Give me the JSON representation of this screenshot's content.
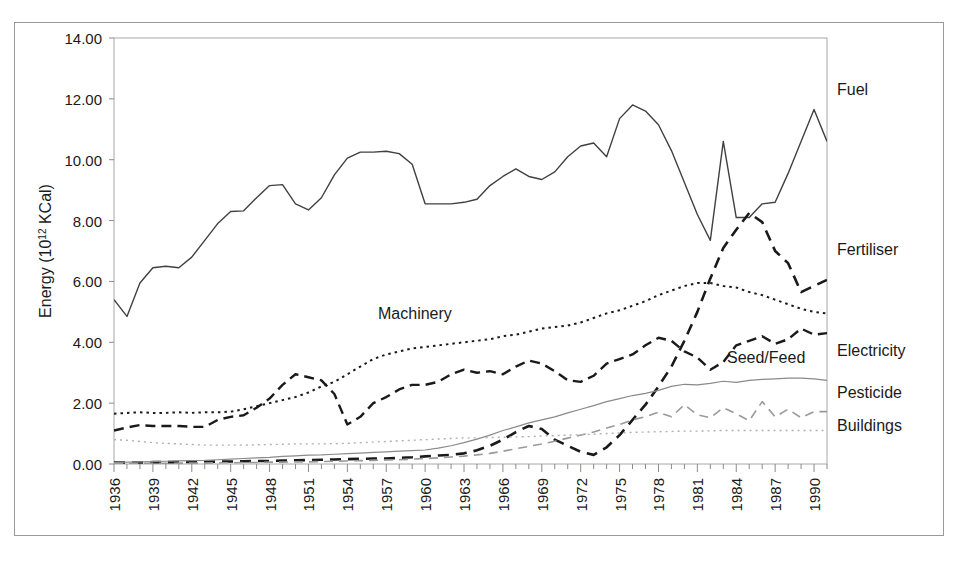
{
  "figure": {
    "frame_color": "#9a9a9a",
    "background": "#ffffff"
  },
  "chart_data": {
    "type": "line",
    "title": "",
    "xlabel": "Year",
    "ylabel": "Energy (10 12 KCal)",
    "ylabel_base": "Energy (10",
    "ylabel_sup": "12",
    "ylabel_tail": " KCal)",
    "grid": false,
    "legend_position": "right-inline-labels",
    "xlim": [
      1936,
      1991
    ],
    "ylim": [
      0,
      14
    ],
    "ytick_labels": [
      "14.00",
      "12.00",
      "10.00",
      "8.00",
      "6.00",
      "4.00",
      "2.00",
      "0.00"
    ],
    "ytick_values": [
      14,
      12,
      10,
      8,
      6,
      4,
      2,
      0
    ],
    "xtick_labels": [
      "1936",
      "1939",
      "1942",
      "1945",
      "1948",
      "1951",
      "1954",
      "1957",
      "1960",
      "1963",
      "1966",
      "1969",
      "1972",
      "1975",
      "1978",
      "1981",
      "1984",
      "1987",
      "1990"
    ],
    "xtick_values": [
      1936,
      1939,
      1942,
      1945,
      1948,
      1951,
      1954,
      1957,
      1960,
      1963,
      1966,
      1969,
      1972,
      1975,
      1978,
      1981,
      1984,
      1987,
      1990
    ],
    "x": [
      1936,
      1937,
      1938,
      1939,
      1940,
      1941,
      1942,
      1943,
      1944,
      1945,
      1946,
      1947,
      1948,
      1949,
      1950,
      1951,
      1952,
      1953,
      1954,
      1955,
      1956,
      1957,
      1958,
      1959,
      1960,
      1961,
      1962,
      1963,
      1964,
      1965,
      1966,
      1967,
      1968,
      1969,
      1970,
      1971,
      1972,
      1973,
      1974,
      1975,
      1976,
      1977,
      1978,
      1979,
      1980,
      1981,
      1982,
      1983,
      1984,
      1985,
      1986,
      1987,
      1988,
      1989,
      1990,
      1991
    ],
    "series": [
      {
        "name": "Fuel",
        "style": "solid",
        "color": "#404040",
        "width": 1.4,
        "label_right": "Fuel",
        "values": [
          5.4,
          4.85,
          5.95,
          6.45,
          6.5,
          6.45,
          6.8,
          7.35,
          7.9,
          8.3,
          8.32,
          8.75,
          9.15,
          9.18,
          8.55,
          8.35,
          8.75,
          9.5,
          10.05,
          10.25,
          10.25,
          10.28,
          10.2,
          9.85,
          8.55,
          8.55,
          8.55,
          8.6,
          8.7,
          9.15,
          9.45,
          9.7,
          9.45,
          9.35,
          9.6,
          10.1,
          10.45,
          10.55,
          10.1,
          11.35,
          11.8,
          11.6,
          11.15,
          10.3,
          9.25,
          8.2,
          7.35,
          10.6,
          8.1,
          8.1,
          8.55,
          8.6,
          9.55,
          10.6,
          11.65,
          10.6
        ]
      },
      {
        "name": "Fertiliser",
        "style": "dashed-thick",
        "color": "#1a1a1a",
        "width": 2.6,
        "label_right": "Fertiliser",
        "values": [
          0.05,
          0.05,
          0.05,
          0.06,
          0.06,
          0.06,
          0.07,
          0.07,
          0.08,
          0.08,
          0.09,
          0.1,
          0.1,
          0.11,
          0.12,
          0.13,
          0.14,
          0.15,
          0.16,
          0.17,
          0.18,
          0.18,
          0.2,
          0.22,
          0.25,
          0.28,
          0.3,
          0.35,
          0.45,
          0.6,
          0.8,
          1.05,
          1.25,
          1.15,
          0.8,
          0.6,
          0.4,
          0.3,
          0.55,
          0.95,
          1.45,
          1.95,
          2.55,
          3.2,
          4.05,
          5.0,
          6.1,
          7.1,
          7.7,
          8.25,
          7.95,
          7.0,
          6.6,
          5.65,
          5.85,
          6.05
        ]
      },
      {
        "name": "Machinery",
        "style": "dashed-medium",
        "color": "#1a1a1a",
        "width": 2.4,
        "label_inline": "Machinery",
        "values": [
          1.1,
          1.2,
          1.28,
          1.25,
          1.25,
          1.25,
          1.22,
          1.22,
          1.45,
          1.55,
          1.6,
          1.85,
          2.15,
          2.6,
          2.95,
          2.85,
          2.75,
          2.3,
          1.3,
          1.55,
          2.0,
          2.2,
          2.45,
          2.6,
          2.6,
          2.7,
          2.95,
          3.1,
          3.0,
          3.05,
          2.95,
          3.2,
          3.4,
          3.3,
          3.05,
          2.75,
          2.7,
          2.9,
          3.3,
          3.45,
          3.6,
          3.9,
          4.15,
          4.05,
          3.7,
          3.5,
          3.1,
          3.35,
          3.9,
          4.05,
          4.2,
          3.95,
          4.1,
          4.45,
          4.25,
          4.3
        ]
      },
      {
        "name": "Seed/Feed",
        "style": "dotted",
        "color": "#1a1a1a",
        "width": 2.0,
        "label_inline": "Seed/Feed",
        "values": [
          1.65,
          1.68,
          1.7,
          1.68,
          1.68,
          1.7,
          1.68,
          1.7,
          1.7,
          1.72,
          1.8,
          1.9,
          2.0,
          2.1,
          2.2,
          2.35,
          2.55,
          2.7,
          2.95,
          3.2,
          3.45,
          3.6,
          3.7,
          3.8,
          3.85,
          3.9,
          3.95,
          4.0,
          4.05,
          4.1,
          4.2,
          4.25,
          4.35,
          4.45,
          4.5,
          4.55,
          4.65,
          4.8,
          4.95,
          5.05,
          5.2,
          5.35,
          5.55,
          5.7,
          5.85,
          5.95,
          5.95,
          5.85,
          5.8,
          5.65,
          5.55,
          5.4,
          5.25,
          5.1,
          5.0,
          4.95
        ]
      },
      {
        "name": "Electricity",
        "style": "solid-thin-light",
        "color": "#8a8a8a",
        "width": 1.2,
        "label_right": "Electricity",
        "values": [
          0.05,
          0.06,
          0.07,
          0.08,
          0.09,
          0.1,
          0.11,
          0.12,
          0.14,
          0.16,
          0.18,
          0.2,
          0.22,
          0.25,
          0.27,
          0.29,
          0.3,
          0.32,
          0.34,
          0.36,
          0.38,
          0.4,
          0.42,
          0.44,
          0.46,
          0.52,
          0.6,
          0.7,
          0.82,
          0.95,
          1.1,
          1.22,
          1.35,
          1.45,
          1.55,
          1.68,
          1.8,
          1.92,
          2.05,
          2.15,
          2.25,
          2.32,
          2.42,
          2.55,
          2.62,
          2.6,
          2.65,
          2.72,
          2.68,
          2.75,
          2.78,
          2.8,
          2.82,
          2.82,
          2.8,
          2.75
        ]
      },
      {
        "name": "Pesticide",
        "style": "dashed-light",
        "color": "#9a9a9a",
        "width": 1.6,
        "label_right": "Pesticide",
        "values": [
          0.02,
          0.02,
          0.02,
          0.02,
          0.02,
          0.03,
          0.03,
          0.03,
          0.04,
          0.04,
          0.05,
          0.05,
          0.06,
          0.06,
          0.07,
          0.07,
          0.08,
          0.09,
          0.1,
          0.11,
          0.12,
          0.13,
          0.14,
          0.16,
          0.18,
          0.2,
          0.23,
          0.26,
          0.3,
          0.35,
          0.42,
          0.5,
          0.58,
          0.66,
          0.75,
          0.85,
          0.95,
          1.05,
          1.18,
          1.3,
          1.45,
          1.55,
          1.7,
          1.55,
          1.95,
          1.62,
          1.52,
          1.85,
          1.65,
          1.42,
          2.05,
          1.55,
          1.8,
          1.52,
          1.72,
          1.72
        ]
      },
      {
        "name": "Buildings",
        "style": "dotted-light",
        "color": "#b0b0b0",
        "width": 1.4,
        "label_right": "Buildings",
        "values": [
          0.8,
          0.78,
          0.74,
          0.7,
          0.68,
          0.66,
          0.64,
          0.62,
          0.62,
          0.62,
          0.62,
          0.63,
          0.64,
          0.65,
          0.66,
          0.66,
          0.66,
          0.67,
          0.68,
          0.7,
          0.72,
          0.74,
          0.76,
          0.78,
          0.8,
          0.82,
          0.84,
          0.86,
          0.86,
          0.87,
          0.88,
          0.89,
          0.9,
          0.92,
          0.93,
          0.95,
          0.96,
          0.98,
          1.0,
          1.02,
          1.04,
          1.05,
          1.06,
          1.07,
          1.08,
          1.08,
          1.09,
          1.1,
          1.1,
          1.1,
          1.1,
          1.1,
          1.1,
          1.1,
          1.1,
          1.1
        ]
      }
    ]
  }
}
